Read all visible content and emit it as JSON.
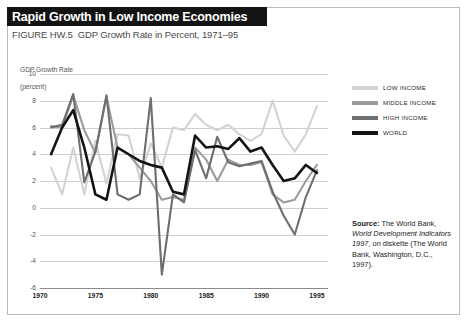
{
  "figure": {
    "title": "Rapid Growth in Low Income Economies",
    "figure_id": "FIGURE HW.5",
    "subtitle": "GDP Growth Rate in Percent, 1971–95"
  },
  "axis": {
    "ylabel_line1": "GDP Growth Rate",
    "ylabel_line2": "(percent)"
  },
  "legend": {
    "items": [
      {
        "label": "LOW INCOME",
        "color": "#d3d3d3"
      },
      {
        "label": "MIDDLE INCOME",
        "color": "#9c9c9c"
      },
      {
        "label": "HIGH INCOME",
        "color": "#6e6e6e"
      },
      {
        "label": "WORLD",
        "color": "#141414"
      }
    ]
  },
  "source": {
    "label": "Source:",
    "text_1": " The World Bank, ",
    "italic_1": "World Development Indicators 1997",
    "text_2": ", on diskette (The World Bank, Washington, D.C., 1997)."
  },
  "chart_data": {
    "type": "line",
    "title": "Rapid Growth in Low Income Economies",
    "subtitle": "GDP Growth Rate in Percent, 1971–95",
    "xlabel": "",
    "ylabel": "GDP Growth Rate (percent)",
    "xlim": [
      1970,
      1996
    ],
    "ylim": [
      -6,
      10
    ],
    "yticks": [
      10,
      8,
      6,
      4,
      2,
      0,
      -2,
      -4,
      -6
    ],
    "xticks": [
      1970,
      1975,
      1980,
      1985,
      1990,
      1995
    ],
    "grid": true,
    "legend_position": "right",
    "x": [
      1971,
      1972,
      1973,
      1974,
      1975,
      1976,
      1977,
      1978,
      1979,
      1980,
      1981,
      1982,
      1983,
      1984,
      1985,
      1986,
      1987,
      1988,
      1989,
      1990,
      1991,
      1992,
      1993,
      1994,
      1995
    ],
    "series": [
      {
        "name": "LOW INCOME",
        "color": "#d3d3d3",
        "values": [
          3.0,
          1.0,
          4.5,
          1.0,
          5.0,
          1.8,
          5.5,
          5.4,
          2.2,
          4.8,
          3.0,
          6.0,
          5.8,
          7.0,
          6.2,
          5.8,
          6.2,
          5.5,
          5.0,
          5.5,
          8.0,
          5.4,
          4.2,
          5.5,
          7.6
        ]
      },
      {
        "name": "MIDDLE INCOME",
        "color": "#9c9c9c",
        "values": [
          6.1,
          6.0,
          8.4,
          5.8,
          4.1,
          8.3,
          4.5,
          4.0,
          3.0,
          2.0,
          0.6,
          0.8,
          0.6,
          4.5,
          3.6,
          2.0,
          3.6,
          3.2,
          3.2,
          3.4,
          1.0,
          0.4,
          0.6,
          2.0,
          3.2
        ]
      },
      {
        "name": "HIGH INCOME",
        "color": "#6e6e6e",
        "values": [
          6.0,
          6.2,
          8.5,
          1.9,
          4.2,
          8.4,
          1.0,
          0.6,
          1.0,
          8.2,
          -5.0,
          1.0,
          0.4,
          4.3,
          2.2,
          5.3,
          3.4,
          3.1,
          3.3,
          3.5,
          1.2,
          -0.6,
          -2.0,
          0.8,
          2.8
        ]
      },
      {
        "name": "WORLD",
        "color": "#141414",
        "values": [
          4.0,
          6.0,
          7.3,
          4.5,
          1.0,
          0.6,
          4.5,
          4.0,
          3.5,
          3.2,
          3.0,
          1.2,
          1.0,
          5.4,
          4.5,
          4.6,
          4.4,
          5.2,
          4.2,
          4.5,
          3.2,
          2.0,
          2.2,
          3.2,
          2.6
        ]
      }
    ]
  }
}
